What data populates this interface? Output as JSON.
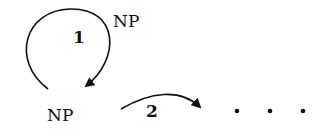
{
  "diagram": {
    "nodes": [
      {
        "id": "np_top",
        "label": "NP"
      },
      {
        "id": "np_bottom",
        "label": "NP"
      },
      {
        "id": "ellipsis",
        "label": "• • •"
      }
    ],
    "edges": [
      {
        "id": "edge_1",
        "label": "1",
        "from": "np_bottom",
        "to": "np_bottom",
        "kind": "loop"
      },
      {
        "id": "edge_2",
        "label": "2",
        "from": "np_bottom",
        "to": "ellipsis",
        "kind": "curved-arrow"
      }
    ]
  },
  "colors": {
    "stroke": "#111111",
    "background": "#ffffff"
  }
}
